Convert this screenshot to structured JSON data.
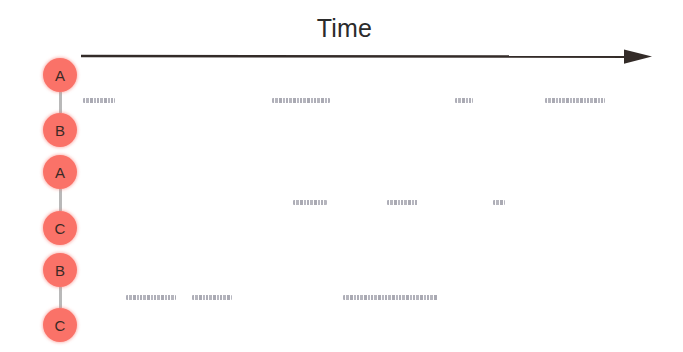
{
  "axis": {
    "title": "Time",
    "direction": "left-to-right",
    "arrow_color": "#332b28",
    "x_start": 80,
    "x_end": 652,
    "y": 56
  },
  "colors": {
    "node_fill": "#fa7268",
    "node_label": "#3a2a26",
    "link": "#b9b9b9",
    "utterance": "#8f8f9c",
    "background": "#ffffff"
  },
  "chain": {
    "nodes": [
      {
        "label": "A",
        "cx": 60,
        "cy": 75,
        "r": 17,
        "pair": 1
      },
      {
        "label": "B",
        "cx": 60,
        "cy": 130,
        "r": 17,
        "pair": 1
      },
      {
        "label": "A",
        "cx": 60,
        "cy": 172,
        "r": 17,
        "pair": 2
      },
      {
        "label": "C",
        "cx": 60,
        "cy": 228,
        "r": 17,
        "pair": 2
      },
      {
        "label": "B",
        "cx": 60,
        "cy": 270,
        "r": 17,
        "pair": 3
      },
      {
        "label": "C",
        "cx": 60,
        "cy": 325,
        "r": 17,
        "pair": 3
      }
    ],
    "links": [
      {
        "from": 0,
        "to": 1,
        "y_top": 92,
        "y_bottom": 113
      },
      {
        "from": 2,
        "to": 3,
        "y_top": 189,
        "y_bottom": 211
      },
      {
        "from": 4,
        "to": 5,
        "y_top": 287,
        "y_bottom": 308
      }
    ]
  },
  "chart_data": {
    "type": "timeline",
    "title": "Time",
    "xlabel": "Time",
    "ylabel": "",
    "grid": false,
    "legend": null,
    "xlim": [
      80,
      652
    ],
    "series": [
      {
        "name": "A-B",
        "pair": [
          "A",
          "B"
        ],
        "row_y": 100,
        "segments": [
          {
            "x_start": 83,
            "x_end": 115,
            "width": 32
          },
          {
            "x_start": 272,
            "x_end": 330,
            "width": 58
          },
          {
            "x_start": 455,
            "x_end": 473,
            "width": 18
          },
          {
            "x_start": 545,
            "x_end": 605,
            "width": 60
          }
        ]
      },
      {
        "name": "A-C",
        "pair": [
          "A",
          "C"
        ],
        "row_y": 202,
        "segments": [
          {
            "x_start": 293,
            "x_end": 327,
            "width": 34
          },
          {
            "x_start": 387,
            "x_end": 418,
            "width": 31
          },
          {
            "x_start": 493,
            "x_end": 505,
            "width": 12
          }
        ]
      },
      {
        "name": "B-C",
        "pair": [
          "B",
          "C"
        ],
        "row_y": 297,
        "segments": [
          {
            "x_start": 126,
            "x_end": 176,
            "width": 50
          },
          {
            "x_start": 192,
            "x_end": 232,
            "width": 40
          },
          {
            "x_start": 343,
            "x_end": 438,
            "width": 95
          }
        ]
      }
    ]
  }
}
